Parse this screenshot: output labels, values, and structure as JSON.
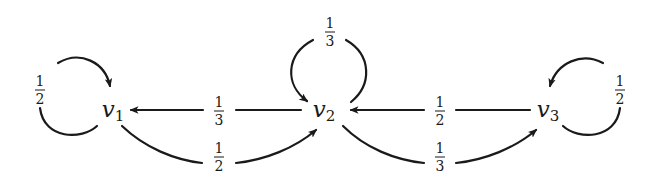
{
  "diagram": {
    "type": "markov-chain",
    "nodes": [
      {
        "id": "v1",
        "base": "v",
        "sub": "1",
        "x": 110,
        "y": 110
      },
      {
        "id": "v2",
        "base": "v",
        "sub": "2",
        "x": 318,
        "y": 110
      },
      {
        "id": "v3",
        "base": "v",
        "sub": "3",
        "x": 540,
        "y": 110
      }
    ],
    "edges": [
      {
        "from": "v1",
        "to": "v1",
        "label": {
          "num": "1",
          "den": "2"
        }
      },
      {
        "from": "v2",
        "to": "v2",
        "label": {
          "num": "1",
          "den": "3"
        }
      },
      {
        "from": "v3",
        "to": "v3",
        "label": {
          "num": "1",
          "den": "2"
        }
      },
      {
        "from": "v2",
        "to": "v1",
        "label": {
          "num": "1",
          "den": "3"
        }
      },
      {
        "from": "v1",
        "to": "v2",
        "label": {
          "num": "1",
          "den": "2"
        }
      },
      {
        "from": "v3",
        "to": "v2",
        "label": {
          "num": "1",
          "den": "2"
        }
      },
      {
        "from": "v2",
        "to": "v3",
        "label": {
          "num": "1",
          "den": "3"
        }
      }
    ],
    "stroke_color": "#1a1a1a"
  }
}
